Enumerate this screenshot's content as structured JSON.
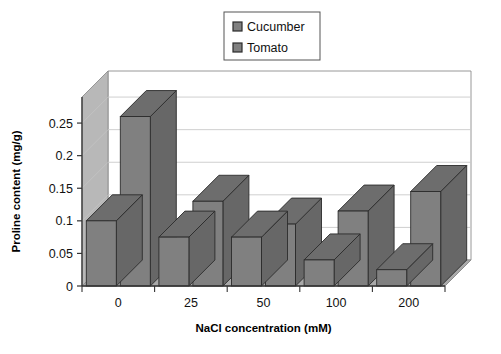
{
  "chart_data": {
    "type": "bar",
    "title": "",
    "subtitle": "",
    "xlabel": "NaCl concentration (mM)",
    "ylabel": "Proline content (mg/g)",
    "categories": [
      "0",
      "25",
      "50",
      "100",
      "200"
    ],
    "series": [
      {
        "name": "Cucumber",
        "values": [
          0.1,
          0.075,
          0.075,
          0.04,
          0.025
        ],
        "color": "#808080"
      },
      {
        "name": "Tomato",
        "values": [
          0.26,
          0.13,
          0.095,
          0.115,
          0.145
        ],
        "color": "#808080"
      }
    ],
    "ytick_labels": [
      "0",
      "0.05",
      "0.1",
      "0.15",
      "0.2",
      "0.25"
    ],
    "ytick_values": [
      0,
      0.05,
      0.1,
      0.15,
      0.2,
      0.25
    ],
    "ylim": [
      0,
      0.29
    ],
    "grid": true,
    "grid_axis": "y",
    "legend_position": "top-center",
    "legend_boxed": true,
    "three_d": true,
    "style": {
      "bar_front": "#808080",
      "bar_top": "#6d6d6d",
      "bar_side": "#676767",
      "bar_edge": "#2b2b2b",
      "floor": "#a9a9a9",
      "back_wall": "#b3b3b3",
      "side_wall": "#b8b8b8",
      "plot_bg": "#ffffff",
      "gridline": "#c9c9c9",
      "axis_line": "#333333",
      "legend_border": "#555555",
      "page_bg": "#ffffff"
    }
  },
  "legend": {
    "items": [
      {
        "label": "Cucumber",
        "swatch_name": "legend-swatch-cucumber"
      },
      {
        "label": "Tomato",
        "swatch_name": "legend-swatch-tomato"
      }
    ]
  },
  "axes": {
    "x_title": "NaCl concentration (mM)",
    "y_title": "Proline content (mg/g)"
  }
}
